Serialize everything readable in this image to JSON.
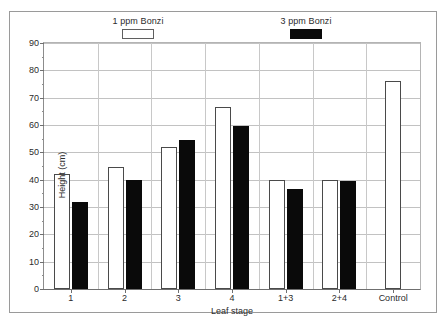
{
  "chart_data": {
    "type": "bar",
    "title": "",
    "xlabel": "Leaf stage",
    "ylabel": "Height (cm)",
    "categories": [
      "1",
      "2",
      "3",
      "4",
      "1+3",
      "2+4",
      "Control"
    ],
    "series": [
      {
        "name": "1 ppm Bonzi",
        "swatch": "white",
        "color": "#ffffff",
        "edge_color": "#4a4a4a",
        "values": [
          42,
          44.5,
          52,
          66.5,
          40,
          40,
          76
        ]
      },
      {
        "name": "3 ppm Bonzi",
        "swatch": "black",
        "color": "#0a0a0a",
        "edge_color": "#0a0a0a",
        "values": [
          32,
          40,
          54.5,
          59.5,
          36.5,
          39.5,
          null
        ]
      }
    ],
    "ylim": [
      0,
      90
    ],
    "ytick_values": [
      0,
      10,
      20,
      30,
      40,
      50,
      60,
      70,
      80,
      90
    ],
    "ytick_labels": [
      "0",
      "10",
      "20",
      "30",
      "40",
      "50",
      "60",
      "70",
      "80",
      "90"
    ],
    "grid": "horizontal",
    "legend_position": "above-plot",
    "legend": [
      {
        "label": "1 ppm Bonzi",
        "swatch": "white"
      },
      {
        "label": "3 ppm Bonzi",
        "swatch": "black"
      }
    ]
  },
  "figure": {
    "background_color": "#ffffff",
    "frame_color": "#9a9a9a",
    "axis_color": "#6f6f6f",
    "grid_color": "#c2c2c2"
  }
}
